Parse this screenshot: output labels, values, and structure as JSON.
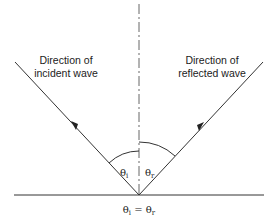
{
  "diagram": {
    "labels": {
      "incident_line1": "Direction of",
      "incident_line2": "incident wave",
      "reflected_line1": "Direction of",
      "reflected_line2": "reflected wave",
      "theta_i": "θi",
      "theta_i_base": "θ",
      "theta_i_sub": "i",
      "theta_r_base": "θ",
      "theta_r_sub": "r",
      "equation_lhs_base": "θ",
      "equation_lhs_sub": "i",
      "equation_eq": " = ",
      "equation_rhs_base": "θ",
      "equation_rhs_sub": "r"
    },
    "colors": {
      "line": "#333333",
      "text": "#222222",
      "background": "#ffffff"
    }
  }
}
